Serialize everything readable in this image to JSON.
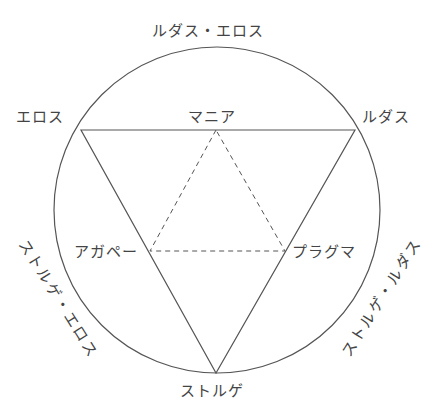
{
  "diagram": {
    "colors": {
      "line": "#555555",
      "text": "#444444",
      "background": "#ffffff"
    },
    "circle": {
      "cx": 217,
      "cy": 210,
      "r": 163
    },
    "outer_triangle": {
      "style": "solid",
      "vertices": [
        {
          "name": "eros",
          "x": 81,
          "y": 130
        },
        {
          "name": "ludus",
          "x": 355,
          "y": 130
        },
        {
          "name": "storge",
          "x": 216,
          "y": 373
        }
      ]
    },
    "inner_triangle": {
      "style": "dashed",
      "vertices": [
        {
          "name": "mania",
          "x": 216,
          "y": 130
        },
        {
          "name": "agape",
          "x": 150,
          "y": 251
        },
        {
          "name": "pragma",
          "x": 285,
          "y": 251
        }
      ]
    },
    "labels": {
      "top": "ルダス・エロス",
      "eros": "エロス",
      "mania": "マニア",
      "ludus": "ルダス",
      "agape": "アガペー",
      "pragma": "プラグマ",
      "storge": "ストルゲ",
      "left_arc": "ストルゲ・エロス",
      "right_arc": "ストルゲ・ルダス"
    }
  }
}
